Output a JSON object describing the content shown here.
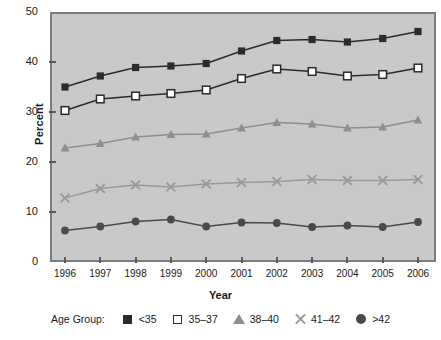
{
  "chart_data": {
    "type": "line",
    "title": "",
    "xlabel": "Year",
    "ylabel": "Percent",
    "categories": [
      "1996",
      "1997",
      "1998",
      "1999",
      "2000",
      "2001",
      "2002",
      "2003",
      "2004",
      "2005",
      "2006"
    ],
    "x": [
      1996,
      1997,
      1998,
      1999,
      2000,
      2001,
      2002,
      2003,
      2004,
      2005,
      2006
    ],
    "xlim": [
      1996,
      2006
    ],
    "ylim": [
      0,
      50
    ],
    "yticks": [
      0,
      10,
      20,
      30,
      40,
      50
    ],
    "ytick_labels": [
      "0",
      "10",
      "20",
      "30",
      "40",
      "50"
    ],
    "grid": false,
    "legend_position": "bottom",
    "legend_title": "Age Group:",
    "plot_background": "#c9c9c9",
    "series": [
      {
        "name": "<35",
        "marker": "filled-square",
        "color": "#2b2b2b",
        "values": [
          35.0,
          37.2,
          38.9,
          39.2,
          39.7,
          42.2,
          44.3,
          44.5,
          44.0,
          44.7,
          46.1
        ]
      },
      {
        "name": "35–37",
        "marker": "open-square",
        "color": "#2b2b2b",
        "values": [
          30.3,
          32.6,
          33.2,
          33.7,
          34.4,
          36.7,
          38.6,
          38.1,
          37.2,
          37.5,
          38.8
        ]
      },
      {
        "name": "38–40",
        "marker": "triangle",
        "color": "#8e8e8e",
        "values": [
          22.8,
          23.7,
          25.0,
          25.5,
          25.6,
          26.8,
          27.9,
          27.6,
          26.8,
          27.0,
          28.4
        ]
      },
      {
        "name": "41–42",
        "marker": "x",
        "color": "#9a9a9a",
        "values": [
          12.8,
          14.7,
          15.4,
          15.0,
          15.6,
          15.9,
          16.1,
          16.5,
          16.3,
          16.3,
          16.5
        ]
      },
      {
        "name": ">42",
        "marker": "circle",
        "color": "#4a4a4a",
        "values": [
          6.3,
          7.1,
          8.1,
          8.5,
          7.1,
          7.9,
          7.8,
          7.0,
          7.3,
          7.0,
          8.0
        ]
      }
    ]
  },
  "legend": {
    "title": "Age Group:",
    "items": [
      {
        "label": "<35",
        "marker": "filled-square"
      },
      {
        "label": "35–37",
        "marker": "open-square"
      },
      {
        "label": "38–40",
        "marker": "triangle"
      },
      {
        "label": "41–42",
        "marker": "x"
      },
      {
        "label": ">42",
        "marker": "circle"
      }
    ]
  },
  "axes": {
    "y_title": "Percent",
    "x_title": "Year"
  }
}
